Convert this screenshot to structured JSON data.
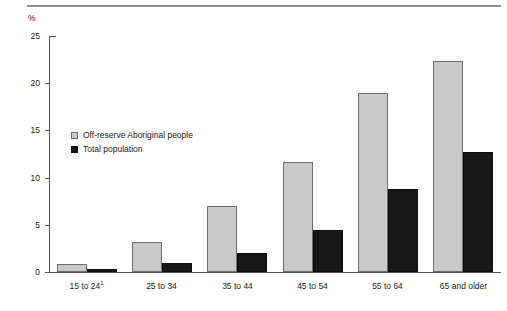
{
  "page": {
    "clipped_header_text": "",
    "unit_label": "%"
  },
  "chart_data": {
    "type": "bar",
    "title": "",
    "xlabel": "",
    "ylabel": "%",
    "ylim": [
      0,
      25
    ],
    "yticks": [
      0,
      5,
      10,
      15,
      20,
      25
    ],
    "grid": false,
    "legend_position": "inside-upper-left",
    "categories": [
      "15 to 24¹",
      "25 to 34",
      "35 to 44",
      "45 to 54",
      "55 to 64",
      "65 and older"
    ],
    "category_footnote_marker": "1",
    "series": [
      {
        "name": "Off-reserve Aboriginal people",
        "color": "#c9c9c9",
        "values": [
          0.9,
          3.2,
          7.0,
          11.6,
          19.0,
          22.3
        ]
      },
      {
        "name": "Total population",
        "color": "#171717",
        "values": [
          0.3,
          1.0,
          2.0,
          4.4,
          8.8,
          12.7
        ]
      }
    ]
  }
}
